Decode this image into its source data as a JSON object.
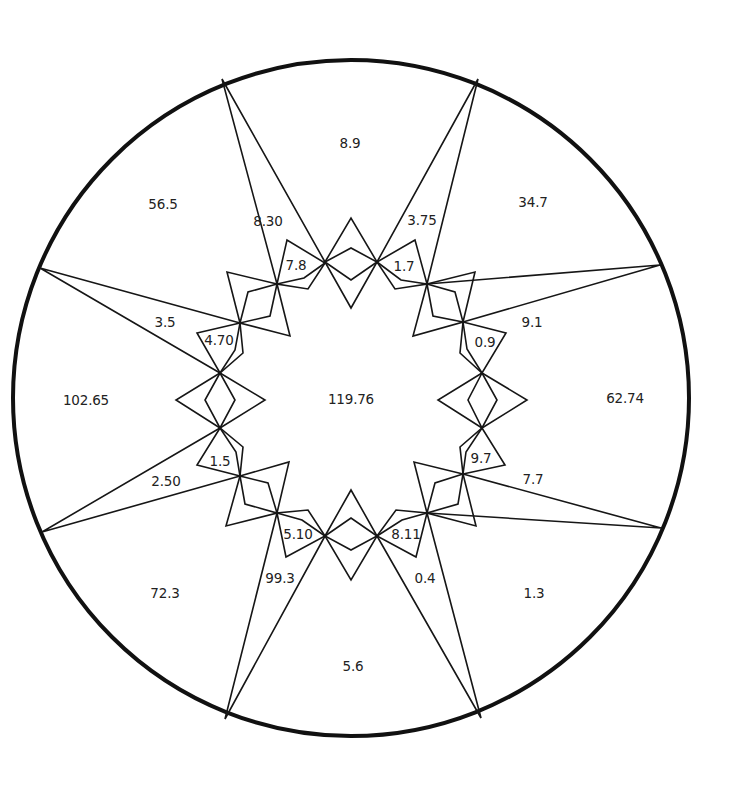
{
  "diagram": {
    "circle": {
      "cx": 351,
      "cy": 398,
      "r": 338
    },
    "center_label": {
      "text": "119.76",
      "x": 351,
      "y": 399
    },
    "outer_regions": [
      {
        "text": "8.9",
        "x": 350,
        "y": 143
      },
      {
        "text": "34.7",
        "x": 533,
        "y": 202
      },
      {
        "text": "62.74",
        "x": 625,
        "y": 398
      },
      {
        "text": "1.3",
        "x": 534,
        "y": 593
      },
      {
        "text": "5.6",
        "x": 353,
        "y": 666
      },
      {
        "text": "72.3",
        "x": 165,
        "y": 593
      },
      {
        "text": "102.65",
        "x": 86,
        "y": 400
      },
      {
        "text": "56.5",
        "x": 163,
        "y": 204
      }
    ],
    "spike_labels": [
      {
        "text": "8.30",
        "x": 268,
        "y": 221
      },
      {
        "text": "3.75",
        "x": 422,
        "y": 220
      },
      {
        "text": "9.1",
        "x": 532,
        "y": 322
      },
      {
        "text": "7.7",
        "x": 533,
        "y": 479
      },
      {
        "text": "0.4",
        "x": 425,
        "y": 578
      },
      {
        "text": "99.3",
        "x": 280,
        "y": 578
      },
      {
        "text": "2.50",
        "x": 166,
        "y": 481
      },
      {
        "text": "3.5",
        "x": 165,
        "y": 322
      }
    ],
    "small_labels": [
      {
        "text": "7.8",
        "x": 296,
        "y": 265
      },
      {
        "text": "1.7",
        "x": 404,
        "y": 266
      },
      {
        "text": "0.9",
        "x": 485,
        "y": 342
      },
      {
        "text": "9.7",
        "x": 481,
        "y": 458
      },
      {
        "text": "8.11",
        "x": 406,
        "y": 534
      },
      {
        "text": "5.10",
        "x": 298,
        "y": 534
      },
      {
        "text": "1.5",
        "x": 220,
        "y": 461
      },
      {
        "text": "4.70",
        "x": 219,
        "y": 340
      }
    ],
    "spikes": [
      {
        "name": "spike-top-left",
        "tip": [
          222,
          79
        ],
        "a": [
          277,
          284
        ],
        "b": [
          325,
          262
        ]
      },
      {
        "name": "spike-top-right",
        "tip": [
          478,
          79
        ],
        "a": [
          377,
          262
        ],
        "b": [
          427,
          284
        ]
      },
      {
        "name": "spike-right-top",
        "tip": [
          660,
          265
        ],
        "a": [
          427,
          284
        ],
        "b": [
          463,
          322
        ]
      },
      {
        "name": "spike-right-bottom",
        "tip": [
          661,
          528
        ],
        "a": [
          463,
          474
        ],
        "b": [
          427,
          513
        ]
      },
      {
        "name": "spike-bottom-right",
        "tip": [
          481,
          718
        ],
        "a": [
          427,
          513
        ],
        "b": [
          377,
          536
        ]
      },
      {
        "name": "spike-bottom-left",
        "tip": [
          225,
          719
        ],
        "a": [
          325,
          536
        ],
        "b": [
          277,
          513
        ]
      },
      {
        "name": "spike-left-bottom",
        "tip": [
          42,
          532
        ],
        "a": [
          240,
          476
        ],
        "b": [
          220,
          428
        ]
      },
      {
        "name": "spike-left-top",
        "tip": [
          40,
          268
        ],
        "a": [
          220,
          373
        ],
        "b": [
          240,
          323
        ]
      }
    ],
    "diamonds": [
      {
        "name": "diamond-top",
        "p1": [
          325,
          262
        ],
        "p2": [
          377,
          262
        ],
        "o1": [
          351,
          218
        ],
        "o2": [
          351,
          308
        ],
        "i1": [
          351,
          248
        ],
        "i2": [
          351,
          280
        ]
      },
      {
        "name": "diamond-right",
        "p1": [
          482,
          373
        ],
        "p2": [
          482,
          428
        ],
        "o1": [
          438,
          400
        ],
        "o2": [
          527,
          400
        ],
        "i1": [
          468,
          400
        ],
        "i2": [
          497,
          400
        ]
      },
      {
        "name": "diamond-bottom",
        "p1": [
          325,
          536
        ],
        "p2": [
          377,
          536
        ],
        "o1": [
          351,
          490
        ],
        "o2": [
          351,
          580
        ],
        "i1": [
          351,
          518
        ],
        "i2": [
          351,
          550
        ]
      },
      {
        "name": "diamond-left",
        "p1": [
          220,
          373
        ],
        "p2": [
          220,
          428
        ],
        "o1": [
          176,
          400
        ],
        "o2": [
          265,
          400
        ],
        "i1": [
          205,
          400
        ],
        "i2": [
          235,
          400
        ]
      }
    ],
    "bowties": [
      {
        "name": "bowtie-upper-left",
        "p1": [
          277,
          284
        ],
        "p2": [
          240,
          323
        ],
        "o1": [
          227,
          272
        ],
        "o2": [
          290,
          336
        ],
        "i1": [
          248,
          292
        ],
        "i2": [
          270,
          316
        ]
      },
      {
        "name": "bowtie-upper-right",
        "p1": [
          427,
          284
        ],
        "p2": [
          463,
          322
        ],
        "o1": [
          475,
          272
        ],
        "o2": [
          413,
          336
        ],
        "i1": [
          455,
          292
        ],
        "i2": [
          433,
          316
        ]
      },
      {
        "name": "bowtie-lower-right",
        "p1": [
          463,
          474
        ],
        "p2": [
          427,
          513
        ],
        "o1": [
          414,
          462
        ],
        "o2": [
          476,
          526
        ],
        "i1": [
          435,
          483
        ],
        "i2": [
          458,
          504
        ]
      },
      {
        "name": "bowtie-lower-left",
        "p1": [
          240,
          476
        ],
        "p2": [
          277,
          513
        ],
        "o1": [
          289,
          462
        ],
        "o2": [
          226,
          526
        ],
        "i1": [
          268,
          483
        ],
        "i2": [
          245,
          504
        ]
      }
    ],
    "kites": [
      {
        "name": "kite-7-8",
        "base": [
          277,
          284
        ],
        "tip": [
          325,
          263
        ],
        "far": [
          287,
          240
        ],
        "near": [
          308,
          289
        ],
        "mid": [
          304,
          278
        ]
      },
      {
        "name": "kite-1-7",
        "base": [
          427,
          284
        ],
        "tip": [
          377,
          262
        ],
        "far": [
          415,
          240
        ],
        "near": [
          395,
          289
        ],
        "mid": [
          401,
          280
        ]
      },
      {
        "name": "kite-0-9",
        "base": [
          463,
          322
        ],
        "tip": [
          482,
          373
        ],
        "far": [
          506,
          333
        ],
        "near": [
          460,
          353
        ],
        "mid": [
          467,
          349
        ]
      },
      {
        "name": "kite-9-7",
        "base": [
          463,
          474
        ],
        "tip": [
          482,
          428
        ],
        "far": [
          505,
          465
        ],
        "near": [
          460,
          447
        ],
        "mid": [
          466,
          452
        ]
      },
      {
        "name": "kite-8-11",
        "base": [
          427,
          513
        ],
        "tip": [
          377,
          536
        ],
        "far": [
          416,
          557
        ],
        "near": [
          396,
          510
        ],
        "mid": [
          402,
          520
        ]
      },
      {
        "name": "kite-5-10",
        "base": [
          277,
          513
        ],
        "tip": [
          325,
          536
        ],
        "far": [
          286,
          557
        ],
        "near": [
          308,
          510
        ],
        "mid": [
          302,
          520
        ]
      },
      {
        "name": "kite-1-5",
        "base": [
          240,
          476
        ],
        "tip": [
          220,
          428
        ],
        "far": [
          197,
          465
        ],
        "near": [
          243,
          447
        ],
        "mid": [
          236,
          452
        ]
      },
      {
        "name": "kite-4-70",
        "base": [
          240,
          323
        ],
        "tip": [
          220,
          373
        ],
        "far": [
          197,
          333
        ],
        "near": [
          243,
          353
        ],
        "mid": [
          235,
          350
        ]
      }
    ]
  }
}
